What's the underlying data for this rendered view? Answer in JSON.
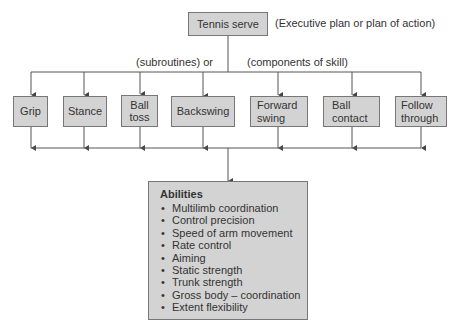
{
  "diagram": {
    "root": {
      "label": "Tennis serve",
      "annotation": "(Executive plan or plan of action)"
    },
    "branch_labels": {
      "left": "(subroutines) or",
      "right": "(components of skill)"
    },
    "components": [
      {
        "label": "Grip"
      },
      {
        "label": "Stance"
      },
      {
        "label": "Ball toss"
      },
      {
        "label": "Backswing"
      },
      {
        "label": "Forward swing"
      },
      {
        "label": "Ball contact"
      },
      {
        "label": "Follow through"
      }
    ],
    "abilities": {
      "title": "Abilities",
      "items": [
        "Multilimb coordination",
        "Control precision",
        "Speed of arm movement",
        "Rate control",
        "Aiming",
        "Static strength",
        "Trunk strength",
        "Gross body – coordination",
        "Extent flexibility"
      ]
    },
    "colors": {
      "box_fill": "#d3d3d3",
      "box_border": "#777777",
      "line": "#555555",
      "text": "#333333"
    }
  }
}
